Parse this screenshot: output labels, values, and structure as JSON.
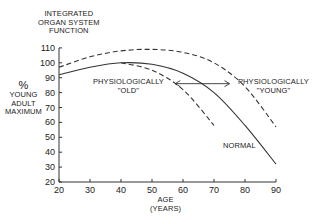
{
  "chart_data": {
    "type": "line",
    "title": "INTEGRATED ORGAN SYSTEM FUNCTION",
    "ylabel": [
      "%",
      "YOUNG",
      "ADULT",
      "MAXIMUM"
    ],
    "xlabel": [
      "AGE",
      "(YEARS)"
    ],
    "xlim": [
      20,
      90
    ],
    "ylim": [
      20,
      110
    ],
    "xticks": [
      20,
      30,
      40,
      50,
      60,
      70,
      80,
      90
    ],
    "yticks": [
      20,
      30,
      40,
      50,
      60,
      70,
      80,
      90,
      100,
      110
    ],
    "grid": false,
    "series": [
      {
        "name": "NORMAL",
        "style": "solid",
        "x": [
          20,
          30,
          40,
          50,
          60,
          70,
          80,
          90
        ],
        "y": [
          92,
          97,
          100,
          99,
          93,
          80,
          58,
          32
        ]
      },
      {
        "name": "PHYSIOLOGICALLY \"YOUNG\"",
        "style": "dashed",
        "x": [
          20,
          30,
          40,
          50,
          60,
          70,
          80,
          90
        ],
        "y": [
          97,
          104,
          108,
          109,
          107,
          100,
          84,
          57
        ]
      },
      {
        "name": "PHYSIOLOGICALLY \"OLD\"",
        "style": "dashed",
        "x": [
          40,
          50,
          60,
          70
        ],
        "y": [
          100,
          95,
          82,
          58
        ]
      }
    ],
    "annotations": [
      {
        "text": "PHYSIOLOGICALLY \"OLD\"",
        "x": 48,
        "y": 86
      },
      {
        "text": "PHYSIOLOGICALLY \"YOUNG\"",
        "x": 88,
        "y": 86
      },
      {
        "text": "NORMAL",
        "x": 78,
        "y": 50
      },
      {
        "text": "double-headed arrow",
        "x_from": 57,
        "x_to": 75,
        "y": 86
      }
    ]
  },
  "labels": {
    "title_lines": [
      "INTEGRATED",
      "ORGAN SYSTEM",
      "FUNCTION"
    ],
    "y_axis": [
      "%",
      "YOUNG",
      "ADULT",
      "MAXIMUM"
    ],
    "x_axis": [
      "AGE",
      "(YEARS)"
    ],
    "old": [
      "PHYSIOLOGICALLY",
      "\"OLD\""
    ],
    "young": [
      "PHYSIOLOGICALLY",
      "\"YOUNG\""
    ],
    "normal": "NORMAL"
  }
}
